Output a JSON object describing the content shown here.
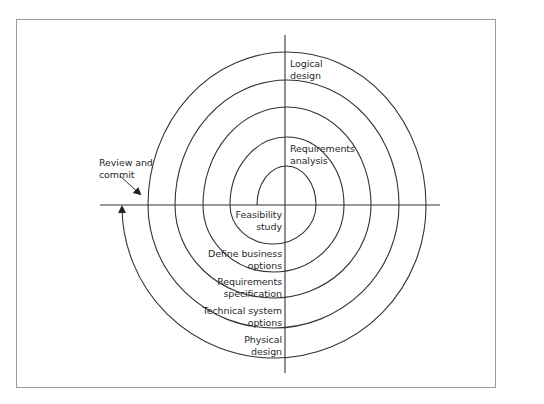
{
  "diagram": {
    "type": "spiral-lifecycle",
    "colors": {
      "line": "#333333",
      "frame": "#9a9a9a",
      "text": "#2a2a2a",
      "background": "#ffffff"
    },
    "labels": {
      "logical_design": "Logical\ndesign",
      "requirements_analysis": "Requirements\nanalysis",
      "review_and_commit": "Review and\ncommit",
      "feasibility_study": "Feasibility\nstudy",
      "define_business_options": "Define business\noptions",
      "requirements_specification": "Requirements\nspecification",
      "technical_system_options": "Technical system\noptions",
      "physical_design": "Physical\ndesign"
    },
    "stages_in_order": [
      "Feasibility study",
      "Requirements analysis",
      "Define business options",
      "Requirements specification",
      "Technical system options",
      "Logical design",
      "Physical design",
      "Review and commit"
    ]
  }
}
